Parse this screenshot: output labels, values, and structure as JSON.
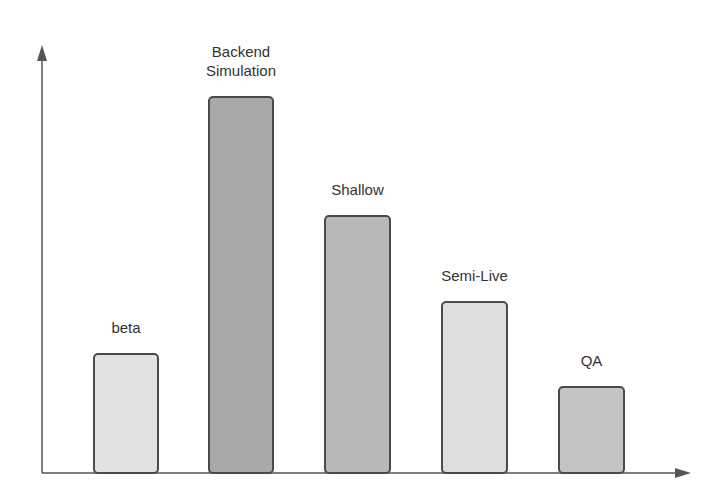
{
  "chart_data": {
    "type": "bar",
    "title": "",
    "xlabel": "",
    "ylabel": "",
    "grid": false,
    "legend": null,
    "axis_ticks": false,
    "categories": [
      "beta",
      "Backend Simulation",
      "Shallow",
      "Semi-Live",
      "QA"
    ],
    "values": [
      120,
      377,
      258,
      172,
      87
    ],
    "value_units": "relative height (px above baseline, no axis scale shown)",
    "ylim": [
      0,
      428
    ],
    "bar_colors": [
      "#e2e2e2",
      "#a9a9a9",
      "#b8b8b8",
      "#dedede",
      "#c4c4c4"
    ]
  },
  "bars": [
    {
      "label": "beta",
      "left": 93,
      "width": 66,
      "height": 120,
      "color": "#e2e2e2"
    },
    {
      "label": "Backend\nSimulation",
      "left": 208,
      "width": 66,
      "height": 377,
      "color": "#a9a9a9"
    },
    {
      "label": "Shallow",
      "left": 324,
      "width": 67,
      "height": 258,
      "color": "#b8b8b8"
    },
    {
      "label": "Semi-Live",
      "left": 441,
      "width": 67,
      "height": 172,
      "color": "#dedede"
    },
    {
      "label": "QA",
      "left": 558,
      "width": 67,
      "height": 87,
      "color": "#c4c4c4"
    }
  ],
  "colors": {
    "axis": "#555555",
    "bar_border": "#4a4a4a",
    "label_text": "#333333",
    "background": "#ffffff"
  }
}
